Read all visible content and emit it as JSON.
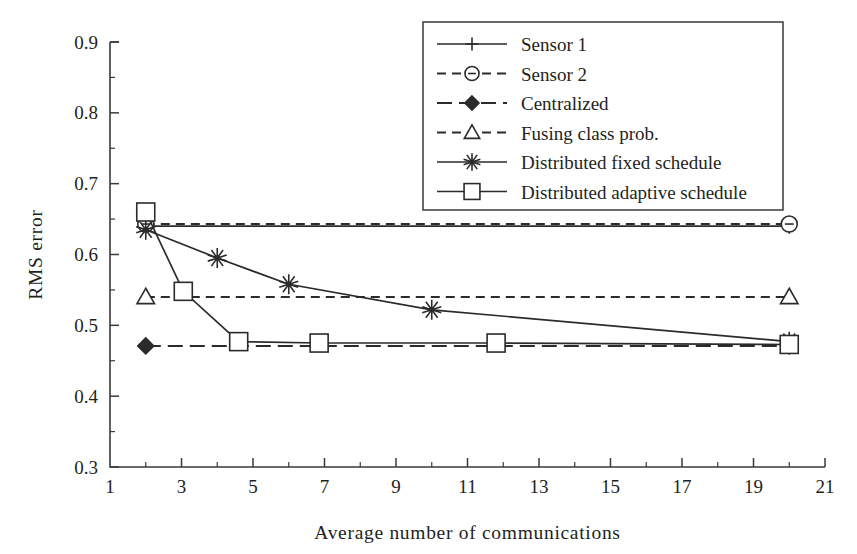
{
  "chart_data": {
    "type": "line",
    "title": "",
    "xlabel": "Average number of communications",
    "ylabel": "RMS error",
    "xlim": [
      1,
      21
    ],
    "ylim": [
      0.3,
      0.9
    ],
    "grid": false,
    "legend_position": "top-right",
    "x_ticks": [
      1,
      3,
      5,
      7,
      9,
      11,
      13,
      15,
      17,
      19,
      21
    ],
    "x_tick_labels": [
      "1",
      "3",
      "5",
      "7",
      "9",
      "11",
      "13",
      "15",
      "17",
      "19",
      "21"
    ],
    "x_minor_ticks": [
      2,
      4,
      6,
      8,
      10,
      12,
      14,
      16,
      18,
      20
    ],
    "y_ticks": [
      0.3,
      0.4,
      0.5,
      0.6,
      0.7,
      0.8,
      0.9
    ],
    "y_tick_labels": [
      "0.3",
      "0.4",
      "0.5",
      "0.6",
      "0.7",
      "0.8",
      "0.9"
    ],
    "y_minor_ticks": [
      0.35,
      0.45,
      0.55,
      0.65,
      0.75,
      0.85
    ],
    "series": [
      {
        "name": "Sensor 1",
        "marker": "plus",
        "dash": "solid",
        "x": [
          2,
          20
        ],
        "values": [
          0.64,
          0.64
        ]
      },
      {
        "name": "Sensor 2",
        "marker": "circle",
        "dash": "dashed",
        "x": [
          2,
          20
        ],
        "values": [
          0.643,
          0.643
        ]
      },
      {
        "name": "Centralized",
        "marker": "diamond",
        "dash": "longdash",
        "x": [
          2,
          20
        ],
        "values": [
          0.471,
          0.471
        ]
      },
      {
        "name": "Fusing class prob.",
        "marker": "triangle",
        "dash": "dashed",
        "x": [
          2,
          20
        ],
        "values": [
          0.54,
          0.54
        ]
      },
      {
        "name": "Distributed fixed schedule",
        "marker": "asterisk",
        "dash": "solid",
        "x": [
          2,
          4,
          6,
          10,
          20
        ],
        "values": [
          0.635,
          0.595,
          0.558,
          0.522,
          0.477
        ]
      },
      {
        "name": "Distributed adaptive schedule",
        "marker": "square",
        "dash": "solid",
        "x": [
          2,
          3.05,
          4.6,
          6.85,
          11.8,
          20
        ],
        "values": [
          0.66,
          0.548,
          0.477,
          0.475,
          0.475,
          0.473
        ]
      }
    ]
  },
  "legend": {
    "entries": [
      {
        "label": "Sensor 1",
        "marker": "plus-marker",
        "dash": "solid"
      },
      {
        "label": "Sensor 2",
        "marker": "circle-marker",
        "dash": "dashed"
      },
      {
        "label": "Centralized",
        "marker": "diamond-marker",
        "dash": "longdash"
      },
      {
        "label": "Fusing class prob.",
        "marker": "triangle-marker",
        "dash": "dashed"
      },
      {
        "label": "Distributed fixed schedule",
        "marker": "asterisk-marker",
        "dash": "solid"
      },
      {
        "label": "Distributed adaptive schedule",
        "marker": "square-marker",
        "dash": "solid"
      }
    ]
  },
  "colors": {
    "ink": "#231f20",
    "line": "#2b2b2b",
    "axis": "#3a3a3a",
    "background": "#ffffff"
  }
}
